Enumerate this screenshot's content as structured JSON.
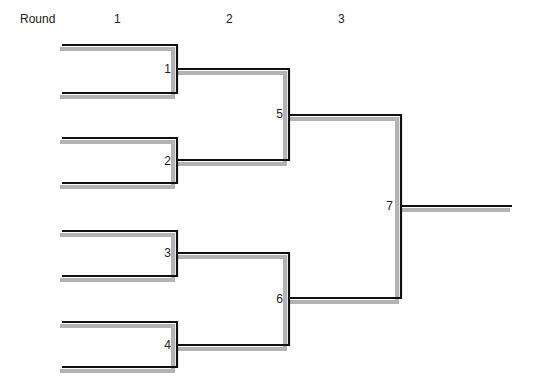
{
  "header": {
    "round_label": "Round",
    "rounds": [
      "1",
      "2",
      "3"
    ]
  },
  "matches": [
    {
      "id": "1",
      "round": 1
    },
    {
      "id": "2",
      "round": 1
    },
    {
      "id": "3",
      "round": 1
    },
    {
      "id": "4",
      "round": 1
    },
    {
      "id": "5",
      "round": 2
    },
    {
      "id": "6",
      "round": 2
    },
    {
      "id": "7",
      "round": 3
    }
  ],
  "colors": {
    "line": "#111111",
    "shadow": "#b3b3b3",
    "background": "#ffffff"
  }
}
